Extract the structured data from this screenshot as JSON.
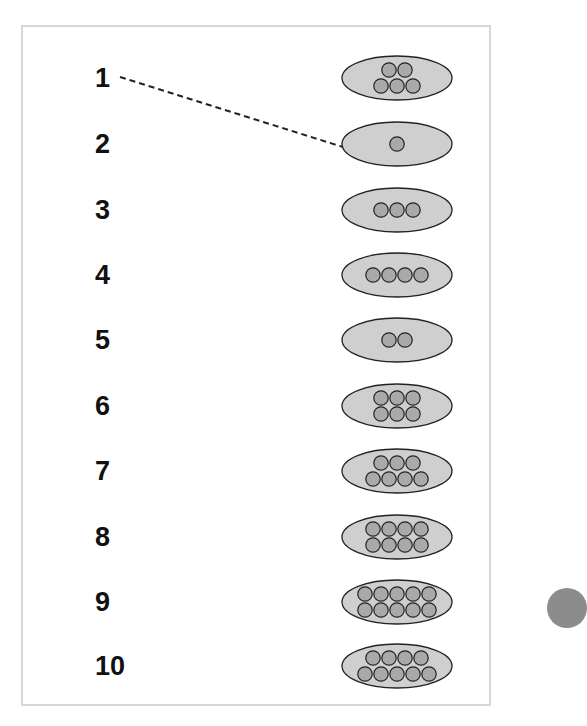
{
  "colors": {
    "frame_border": "#d6d6d6",
    "ellipse_fill": "#cfcfcf",
    "dot_fill": "#a9a9a9",
    "stroke": "#222222",
    "label": "#111111"
  },
  "rows": [
    {
      "label": "1",
      "dots": 5,
      "layout": [
        2,
        3
      ]
    },
    {
      "label": "2",
      "dots": 1,
      "layout": [
        1
      ]
    },
    {
      "label": "3",
      "dots": 3,
      "layout": [
        3
      ]
    },
    {
      "label": "4",
      "dots": 4,
      "layout": [
        4
      ]
    },
    {
      "label": "5",
      "dots": 2,
      "layout": [
        2
      ]
    },
    {
      "label": "6",
      "dots": 6,
      "layout": [
        3,
        3
      ]
    },
    {
      "label": "7",
      "dots": 7,
      "layout": [
        3,
        4
      ]
    },
    {
      "label": "8",
      "dots": 8,
      "layout": [
        4,
        4
      ]
    },
    {
      "label": "9",
      "dots": 10,
      "layout": [
        5,
        5
      ]
    },
    {
      "label": "10",
      "dots": 9,
      "layout": [
        4,
        5
      ]
    }
  ],
  "connector": {
    "from_label": "1",
    "to_set_row": 2,
    "style": "dashed"
  }
}
